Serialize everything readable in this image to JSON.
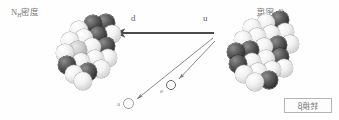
{
  "figure": {
    "width": 339,
    "height": 120,
    "background": "#fefefe",
    "type": "scientific-diagram"
  },
  "labels": {
    "left_cluster": {
      "element": "N",
      "subscript": "H",
      "cjk": "密度",
      "full": "Nₕ密度"
    },
    "right_cluster": {
      "element": "C",
      "subscript": "H",
      "cjk": "密度",
      "full": "Cₕ密度"
    },
    "arrow_d": "d",
    "arrow_u": "u",
    "particle_a": "a",
    "particle_e": "e"
  },
  "caption": {
    "text": "转换",
    "italic_symbol": "β",
    "full": "转换β"
  },
  "arrows": [
    {
      "name": "main-transition-arrow",
      "from": [
        214,
        33
      ],
      "to": [
        113,
        33
      ],
      "direction": "left",
      "label": "d",
      "style": "solid-thick",
      "color": "#4a4a4a"
    },
    {
      "name": "particle-a-arrow",
      "from": [
        213,
        38
      ],
      "to": [
        136,
        99
      ],
      "direction": "down-left",
      "label": "a",
      "style": "solid-thin",
      "color": "#7a7a7a"
    },
    {
      "name": "particle-e-arrow",
      "from": [
        215,
        40
      ],
      "to": [
        178,
        79
      ],
      "direction": "down-left",
      "label": "e",
      "style": "solid-thin",
      "color": "#7a7a7a"
    }
  ],
  "colors": {
    "dark_sphere": "#343434",
    "light_sphere": "#f2f2f2",
    "mid_sphere": "#cdcdcd",
    "arrow": "#4a4a4a",
    "thin_arrow": "#7a7a7a",
    "text": "#7a7a7a",
    "caption_border": "#b4b4b4"
  },
  "clusters": {
    "left": {
      "name": "daughter-nucleus",
      "x": 36,
      "y": 14,
      "spheres": [
        {
          "cx": 43,
          "cy": 16,
          "r": 9,
          "shade": "light"
        },
        {
          "cx": 57,
          "cy": 10,
          "r": 9,
          "shade": "dark"
        },
        {
          "cx": 70,
          "cy": 9,
          "r": 9,
          "shade": "dark"
        },
        {
          "cx": 34,
          "cy": 27,
          "r": 9,
          "shade": "light"
        },
        {
          "cx": 48,
          "cy": 24,
          "r": 9,
          "shade": "light"
        },
        {
          "cx": 62,
          "cy": 21,
          "r": 9,
          "shade": "dark"
        },
        {
          "cx": 76,
          "cy": 20,
          "r": 9,
          "shade": "light"
        },
        {
          "cx": 29,
          "cy": 39,
          "r": 9,
          "shade": "light"
        },
        {
          "cx": 42,
          "cy": 36,
          "r": 9,
          "shade": "mid"
        },
        {
          "cx": 56,
          "cy": 33,
          "r": 9,
          "shade": "light"
        },
        {
          "cx": 70,
          "cy": 32,
          "r": 9,
          "shade": "dark"
        },
        {
          "cx": 31,
          "cy": 51,
          "r": 9,
          "shade": "dark"
        },
        {
          "cx": 45,
          "cy": 48,
          "r": 9,
          "shade": "light"
        },
        {
          "cx": 59,
          "cy": 45,
          "r": 9,
          "shade": "light"
        },
        {
          "cx": 72,
          "cy": 44,
          "r": 9,
          "shade": "light"
        },
        {
          "cx": 38,
          "cy": 60,
          "r": 9,
          "shade": "light"
        },
        {
          "cx": 52,
          "cy": 58,
          "r": 9,
          "shade": "dark"
        },
        {
          "cx": 65,
          "cy": 55,
          "r": 9,
          "shade": "light"
        },
        {
          "cx": 47,
          "cy": 67,
          "r": 9,
          "shade": "light"
        }
      ]
    },
    "right": {
      "name": "parent-nucleus",
      "x": 222,
      "y": 12,
      "spheres": [
        {
          "cx": 30,
          "cy": 16,
          "r": 9,
          "shade": "light"
        },
        {
          "cx": 44,
          "cy": 11,
          "r": 9,
          "shade": "light"
        },
        {
          "cx": 58,
          "cy": 8,
          "r": 9,
          "shade": "dark"
        },
        {
          "cx": 21,
          "cy": 28,
          "r": 9,
          "shade": "light"
        },
        {
          "cx": 35,
          "cy": 25,
          "r": 9,
          "shade": "light"
        },
        {
          "cx": 49,
          "cy": 22,
          "r": 9,
          "shade": "light"
        },
        {
          "cx": 63,
          "cy": 20,
          "r": 9,
          "shade": "light"
        },
        {
          "cx": 14,
          "cy": 40,
          "r": 9,
          "shade": "dark"
        },
        {
          "cx": 28,
          "cy": 38,
          "r": 9,
          "shade": "dark"
        },
        {
          "cx": 42,
          "cy": 35,
          "r": 9,
          "shade": "light"
        },
        {
          "cx": 56,
          "cy": 33,
          "r": 9,
          "shade": "dark"
        },
        {
          "cx": 68,
          "cy": 32,
          "r": 9,
          "shade": "light"
        },
        {
          "cx": 16,
          "cy": 52,
          "r": 9,
          "shade": "dark"
        },
        {
          "cx": 30,
          "cy": 50,
          "r": 9,
          "shade": "light"
        },
        {
          "cx": 44,
          "cy": 47,
          "r": 9,
          "shade": "light"
        },
        {
          "cx": 58,
          "cy": 45,
          "r": 9,
          "shade": "dark"
        },
        {
          "cx": 22,
          "cy": 62,
          "r": 9,
          "shade": "light"
        },
        {
          "cx": 36,
          "cy": 60,
          "r": 9,
          "shade": "light"
        },
        {
          "cx": 50,
          "cy": 58,
          "r": 9,
          "shade": "light"
        },
        {
          "cx": 62,
          "cy": 56,
          "r": 9,
          "shade": "light"
        },
        {
          "cx": 33,
          "cy": 70,
          "r": 9,
          "shade": "light"
        },
        {
          "cx": 47,
          "cy": 68,
          "r": 9,
          "shade": "dark"
        }
      ]
    }
  },
  "particles": [
    {
      "name": "alpha-particle",
      "label": "a",
      "x": 123,
      "y": 98,
      "d": 11,
      "fill": "#ffffff",
      "stroke": "#9d9d9d"
    },
    {
      "name": "electron-particle",
      "label": "e",
      "x": 166,
      "y": 80,
      "d": 10,
      "fill": "#fdfdfd",
      "stroke": "#666666"
    }
  ]
}
